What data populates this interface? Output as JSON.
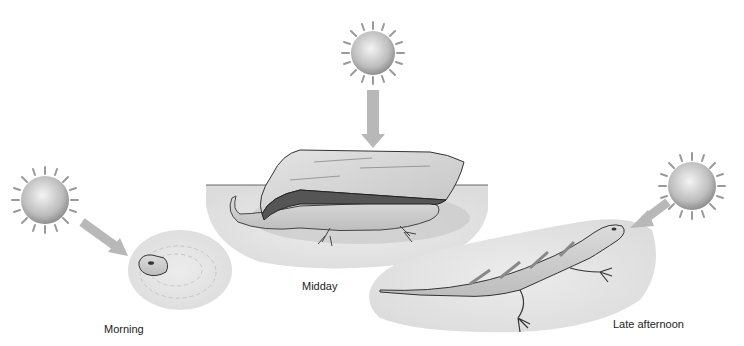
{
  "panels": [
    {
      "id": "morning",
      "label": "Morning",
      "sun_position": "low-left",
      "behavior": "lizard head peeking out of burrow in sand"
    },
    {
      "id": "midday",
      "label": "Midday",
      "sun_position": "overhead",
      "behavior": "lizard sheltering under rock"
    },
    {
      "id": "late-afternoon",
      "label": "Late afternoon",
      "sun_position": "low-right",
      "behavior": "lizard basking on sand"
    }
  ],
  "colors": {
    "sun_core": "#f2f2f2",
    "sun_edge": "#9a9a9a",
    "arrow": "#b8b8b8",
    "sand": "#e6e6e6",
    "rock": "#d6d6d6",
    "lizard": "#cfcfcf",
    "text": "#222222"
  }
}
